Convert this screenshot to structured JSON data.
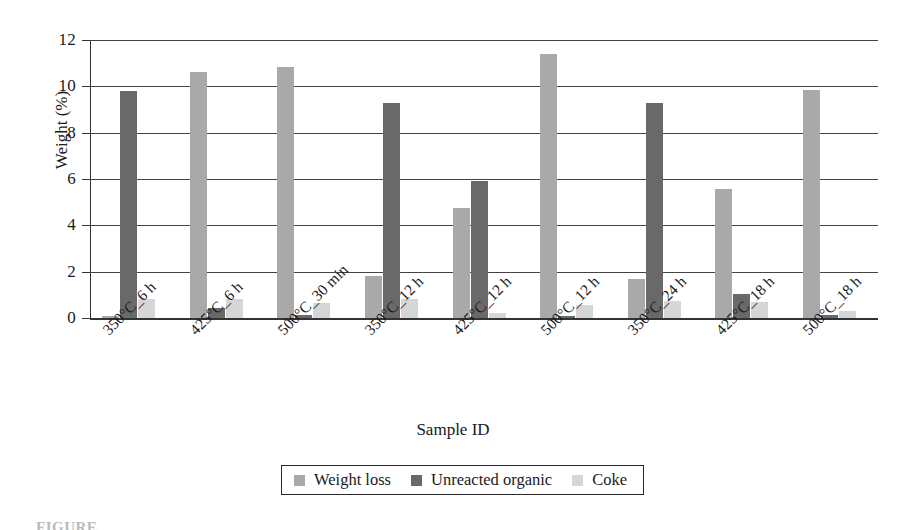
{
  "chart_data": {
    "type": "bar",
    "title": "",
    "xlabel": "Sample ID",
    "ylabel": "Weight (%)",
    "ylim": [
      0,
      12
    ],
    "yticks": [
      0,
      2,
      4,
      6,
      8,
      10,
      12
    ],
    "grid": true,
    "legend_position": "bottom",
    "categories": [
      "350°C_6 h",
      "425°C_6 h",
      "500°C_30 min",
      "350°C_12 h",
      "425°C_12 h",
      "500°C_12 h",
      "350°C_24 h",
      "425°C_18 h",
      "500°C_18 h"
    ],
    "series": [
      {
        "name": "Weight loss",
        "color": "#a9a9a9",
        "values": [
          0.1,
          10.6,
          10.85,
          1.8,
          4.75,
          11.4,
          1.7,
          5.55,
          9.85
        ]
      },
      {
        "name": "Unreacted organic",
        "color": "#696969",
        "values": [
          9.8,
          0.45,
          0.15,
          9.3,
          5.9,
          0.1,
          9.3,
          1.05,
          0.12
        ]
      },
      {
        "name": "Coke",
        "color": "#d6d6d6",
        "values": [
          0.8,
          0.8,
          0.65,
          0.8,
          0.2,
          0.55,
          0.75,
          0.7,
          0.3
        ]
      }
    ]
  },
  "caption": "FIGURE"
}
